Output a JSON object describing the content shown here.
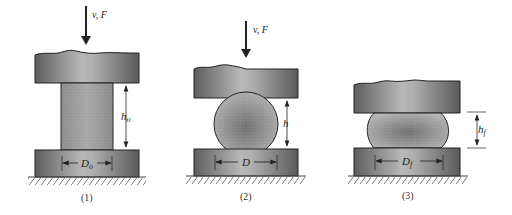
{
  "diagram": {
    "panels": [
      {
        "id": 1,
        "caption": "(1)",
        "force_label": "v, F",
        "height_label": "h",
        "height_sub": "o",
        "diameter_label": "D",
        "diameter_sub": "o",
        "workpiece_shape": "cylinder"
      },
      {
        "id": 2,
        "caption": "(2)",
        "force_label": "v, F",
        "height_label": "h",
        "height_sub": "",
        "diameter_label": "D",
        "diameter_sub": "",
        "workpiece_shape": "sphere"
      },
      {
        "id": 3,
        "caption": "(3)",
        "height_label": "h",
        "height_sub": "f",
        "diameter_label": "D",
        "diameter_sub": "f",
        "workpiece_shape": "barrel"
      }
    ],
    "colors": {
      "platen_dark": "#5a5a5a",
      "platen_light": "#b4b4b4",
      "workpiece": "#9a9a9a",
      "outline": "#222222",
      "ground_hatch": "#777777"
    }
  }
}
